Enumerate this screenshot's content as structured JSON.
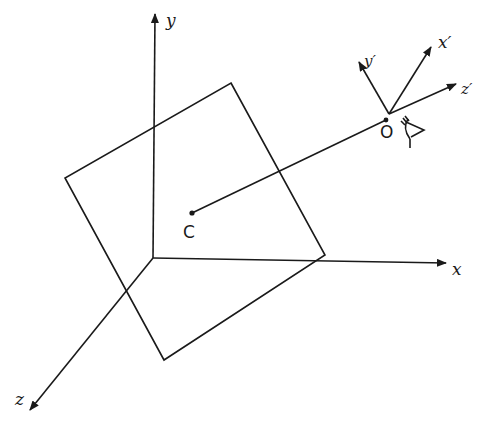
{
  "diagram": {
    "world_axes": {
      "x_label": "x",
      "y_label": "y",
      "z_label": "z"
    },
    "view_axes": {
      "x_label": "x′",
      "y_label": "y′",
      "z_label": "z′"
    },
    "points": {
      "center_label": "C",
      "eye_label": "O"
    },
    "colors": {
      "stroke": "#1a1a1a",
      "background": "#ffffff"
    }
  }
}
